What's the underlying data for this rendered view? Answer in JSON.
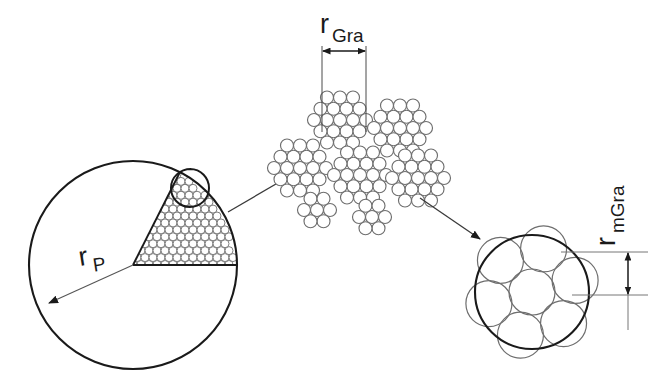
{
  "figure": {
    "domain": "diagram",
    "background_color": "#ffffff",
    "width": 663,
    "height": 389,
    "stroke_dark": "#1a1a1a",
    "stroke_gray": "#6e6e6e",
    "stroke_mid": "#4a4a4a"
  },
  "labels": {
    "particle_radius": {
      "base": "r",
      "subscript": "P",
      "full": "rP"
    },
    "granule_radius": {
      "base": "r",
      "subscript": "Gra",
      "full": "rGra"
    },
    "microgranule_radius": {
      "base": "r",
      "subscript": "mGra",
      "full": "rmGra"
    }
  },
  "stages": {
    "particle": {
      "name": "particle",
      "shape": "circle",
      "center_x": 133,
      "center_y": 265,
      "radius": 104,
      "wedge_description": "sector filled with hexagonally packed small circles",
      "packing_circle_diameter": 8,
      "highlight_circle": {
        "center_x": 190,
        "center_y": 188,
        "radius": 19
      },
      "dimension_arrow": {
        "from_x": 133,
        "from_y": 265,
        "to_x": 47,
        "to_y": 304
      }
    },
    "granules": {
      "name": "granule-cluster-group",
      "count": 7,
      "packing_circle_diameter": 13,
      "clusters": [
        {
          "id": 1,
          "cx": 340,
          "cy": 120,
          "rings": 2
        },
        {
          "id": 2,
          "cx": 400,
          "cy": 128,
          "rings": 2
        },
        {
          "id": 3,
          "cx": 300,
          "cy": 168,
          "rings": 2
        },
        {
          "id": 4,
          "cx": 360,
          "cy": 175,
          "rings": 2
        },
        {
          "id": 5,
          "cx": 418,
          "cy": 178,
          "rings": 2
        },
        {
          "id": 6,
          "cx": 317,
          "cy": 210,
          "rings": 1
        },
        {
          "id": 7,
          "cx": 372,
          "cy": 217,
          "rings": 1
        }
      ],
      "dimension": {
        "left_x": 322,
        "right_x": 365,
        "arrow_y": 50,
        "ext_line_bottom_y": 132
      }
    },
    "microgranule": {
      "name": "microgranule",
      "shape": "circle",
      "center_x": 532,
      "center_y": 292,
      "radius": 57,
      "inner_circle_count": 7,
      "inner_circle_radius": 23,
      "inner_arrangement": "one center circle surrounded by six",
      "dimension": {
        "ext_line_top_y": 252,
        "ext_line_bottom_y": 295,
        "arrow_x": 628,
        "ext_line_right_x": 648
      }
    }
  },
  "arrows": [
    {
      "name": "arrow-particle-to-granules",
      "from_x": 228,
      "from_y": 212,
      "to_x": 290,
      "to_y": 176,
      "direction": "up-right"
    },
    {
      "name": "arrow-granules-to-microgranule",
      "from_x": 418,
      "from_y": 196,
      "to_x": 482,
      "to_y": 240,
      "direction": "down-right"
    }
  ]
}
